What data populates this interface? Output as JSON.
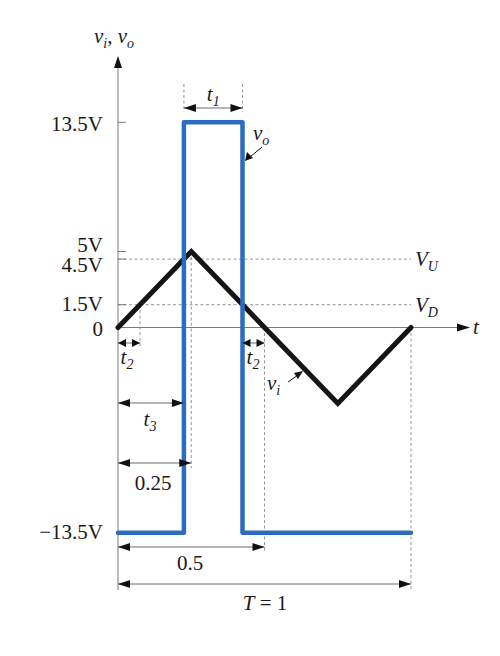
{
  "chart_data": {
    "type": "line",
    "title": "",
    "ylabel": {
      "first_base": "v",
      "first_sub": "i",
      "separator": ", ",
      "second_base": "v",
      "second_sub": "o"
    },
    "xlabel": "t",
    "xlim": [
      0,
      1
    ],
    "ylim": [
      -13.5,
      13.5
    ],
    "grid": false,
    "yticks": [
      {
        "value": 13.5,
        "label": "13.5V"
      },
      {
        "value": 5,
        "label": "5V"
      },
      {
        "value": 4.5,
        "label": "4.5V"
      },
      {
        "value": 1.5,
        "label": "1.5V"
      },
      {
        "value": 0,
        "label": "0"
      },
      {
        "value": -13.5,
        "label": "−13.5V"
      }
    ],
    "series": [
      {
        "name": "v_i",
        "label_base": "v",
        "label_sub": "i",
        "color": "#151515",
        "points": [
          [
            0,
            0
          ],
          [
            0.25,
            5
          ],
          [
            0.75,
            -5
          ],
          [
            1,
            0
          ]
        ]
      },
      {
        "name": "v_o",
        "label_base": "v",
        "label_sub": "o",
        "color": "#2b6cc2",
        "points": [
          [
            0,
            -13.5
          ],
          [
            0.225,
            -13.5
          ],
          [
            0.225,
            13.5
          ],
          [
            0.425,
            13.5
          ],
          [
            0.425,
            -13.5
          ],
          [
            1,
            -13.5
          ]
        ]
      }
    ],
    "thresholds": [
      {
        "value": 4.5,
        "base": "V",
        "sub": "U"
      },
      {
        "value": 1.5,
        "base": "V",
        "sub": "D"
      }
    ],
    "intervals": [
      {
        "id": "t1",
        "base": "t",
        "sub": "1",
        "start": 0.225,
        "end": 0.425
      },
      {
        "id": "t2a",
        "base": "t",
        "sub": "2",
        "start": 0,
        "end": 0.075
      },
      {
        "id": "t2b",
        "base": "t",
        "sub": "2",
        "start": 0.425,
        "end": 0.5
      },
      {
        "id": "t3",
        "base": "t",
        "sub": "3",
        "start": 0,
        "end": 0.225
      },
      {
        "id": "quarter",
        "text": "0.25",
        "start": 0,
        "end": 0.25
      },
      {
        "id": "half",
        "text": "0.5",
        "start": 0,
        "end": 0.5
      },
      {
        "id": "period",
        "base": "T",
        "suffix": " = 1",
        "start": 0,
        "end": 1
      }
    ]
  }
}
